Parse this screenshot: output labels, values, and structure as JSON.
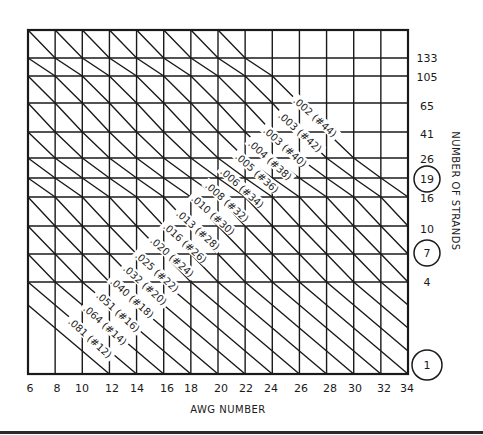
{
  "chart_data": {
    "type": "line",
    "title": "",
    "xlabel": "AWG NUMBER",
    "ylabel": "NUMBER OF STRANDS",
    "x_ticks": [
      "6",
      "8",
      "10",
      "12",
      "14",
      "16",
      "18",
      "20",
      "22",
      "24",
      "26",
      "28",
      "30",
      "32",
      "34"
    ],
    "y_ticks": [
      "133",
      "105",
      "65",
      "41",
      "26",
      "19",
      "16",
      "10",
      "7",
      "4",
      "1"
    ],
    "y_ticks_circled": [
      "19",
      "7",
      "1"
    ],
    "xlim": [
      6,
      34
    ],
    "grid": true,
    "legend": null,
    "series": [
      {
        "name": ".002 (#44)",
        "diameter_in": 0.002,
        "equivalent_awg": 44
      },
      {
        "name": ".003 (#42)",
        "diameter_in": 0.003,
        "equivalent_awg": 42
      },
      {
        "name": ".003 (#40)",
        "diameter_in": 0.003,
        "equivalent_awg": 40
      },
      {
        "name": ".004 (#38)",
        "diameter_in": 0.004,
        "equivalent_awg": 38
      },
      {
        "name": ".005 (#36)",
        "diameter_in": 0.005,
        "equivalent_awg": 36
      },
      {
        "name": ".006 (#34)",
        "diameter_in": 0.006,
        "equivalent_awg": 34
      },
      {
        "name": ".008 (#32)",
        "diameter_in": 0.008,
        "equivalent_awg": 32
      },
      {
        "name": ".010 (#30)",
        "diameter_in": 0.01,
        "equivalent_awg": 30
      },
      {
        "name": ".013 (#28)",
        "diameter_in": 0.013,
        "equivalent_awg": 28
      },
      {
        "name": ".016 (#26)",
        "diameter_in": 0.016,
        "equivalent_awg": 26
      },
      {
        "name": ".020 (#24)",
        "diameter_in": 0.02,
        "equivalent_awg": 24
      },
      {
        "name": ".025 (#22)",
        "diameter_in": 0.025,
        "equivalent_awg": 22
      },
      {
        "name": ".032 (#20)",
        "diameter_in": 0.032,
        "equivalent_awg": 20
      },
      {
        "name": ".040 (#18)",
        "diameter_in": 0.04,
        "equivalent_awg": 18
      },
      {
        "name": ".051 (#16)",
        "diameter_in": 0.051,
        "equivalent_awg": 16
      },
      {
        "name": ".064 (#14)",
        "diameter_in": 0.064,
        "equivalent_awg": 14
      },
      {
        "name": ".081 (#12)",
        "diameter_in": 0.081,
        "equivalent_awg": 12
      }
    ],
    "annotations": [
      {
        "text": ".002 (#44)",
        "x": 315,
        "y": 117
      },
      {
        "text": ".003 (#42)",
        "x": 300,
        "y": 132
      },
      {
        "text": ".003 (#40)",
        "x": 285,
        "y": 147
      },
      {
        "text": ".004 (#38)",
        "x": 270,
        "y": 160
      },
      {
        "text": ".005 (#36)",
        "x": 257,
        "y": 173
      },
      {
        "text": ".006 (#34)",
        "x": 242,
        "y": 188
      },
      {
        "text": ".008 (#32)",
        "x": 227,
        "y": 202
      },
      {
        "text": ".010 (#30)",
        "x": 213,
        "y": 215
      },
      {
        "text": ".013 (#28)",
        "x": 198,
        "y": 230
      },
      {
        "text": ".016 (#26)",
        "x": 185,
        "y": 243
      },
      {
        "text": ".020 (#24)",
        "x": 172,
        "y": 257
      },
      {
        "text": ".025 (#22)",
        "x": 157,
        "y": 272
      },
      {
        "text": ".032 (#20)",
        "x": 145,
        "y": 285
      },
      {
        "text": ".040 (#18)",
        "x": 132,
        "y": 298
      },
      {
        "text": ".051 (#16)",
        "x": 118,
        "y": 312
      },
      {
        "text": ".064 (#14)",
        "x": 105,
        "y": 325
      },
      {
        "text": ".081 (#12)",
        "x": 90,
        "y": 338
      }
    ],
    "layout": {
      "frame": {
        "x0": 28,
        "y0": 30,
        "x1": 408,
        "y1": 374
      },
      "col_count": 14,
      "row_y": [
        30,
        58,
        76,
        103,
        132,
        158,
        178,
        197,
        226,
        254,
        282,
        305,
        328,
        351,
        374
      ],
      "row_labels_index": [
        1,
        2,
        3,
        4,
        5,
        6,
        7,
        8,
        9,
        10,
        14
      ],
      "horizontal_grid_rows": [
        1,
        2,
        3,
        4,
        5,
        6,
        7,
        8,
        9,
        10
      ],
      "diagonal_k_range": [
        -11,
        7
      ],
      "label_angle_deg": 42,
      "tick_label_y": 392,
      "x_tick_positions": [
        30,
        57,
        82,
        112,
        137,
        167,
        191,
        221,
        246,
        271,
        301,
        330,
        355,
        384,
        407
      ],
      "y_tick_positions": [
        58,
        77,
        106,
        134,
        159,
        179,
        198,
        229,
        253,
        282,
        365
      ],
      "y_tick_x": 427,
      "circle_radius": 13
    }
  }
}
